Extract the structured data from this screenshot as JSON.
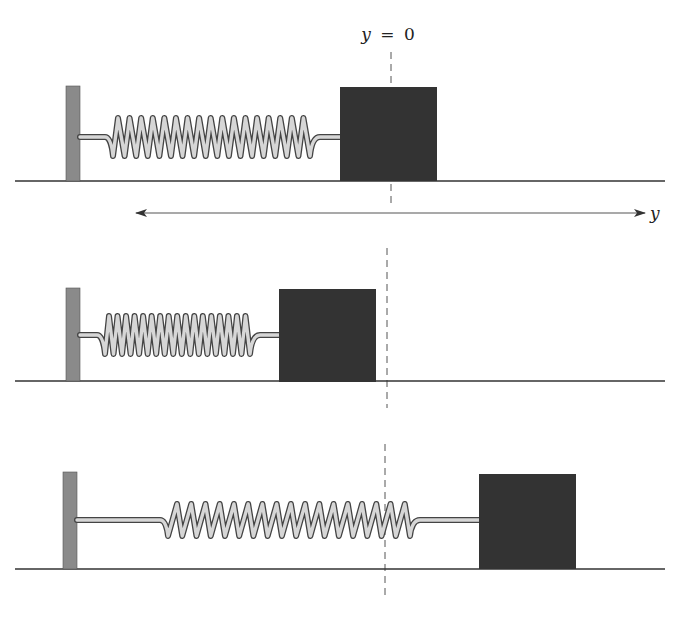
{
  "figure": {
    "type": "mass-spring diagram",
    "equilibrium_label": {
      "var": "y",
      "eq": "=",
      "value": "0"
    },
    "axis_label": "y",
    "colors": {
      "wall": "#8a8a8a",
      "mass": "#333333",
      "spring_fill": "#d6d6d6",
      "spring_stroke": "#444444",
      "floor": "#333333",
      "dashed_line": "#555555"
    },
    "panels": [
      {
        "name": "equilibrium",
        "state": "at equilibrium (spring natural length)",
        "coils": 17
      },
      {
        "name": "compressed",
        "state": "spring compressed, mass left of y = 0",
        "coils": 17
      },
      {
        "name": "stretched",
        "state": "spring stretched, mass right of y = 0",
        "coils": 17
      }
    ]
  }
}
